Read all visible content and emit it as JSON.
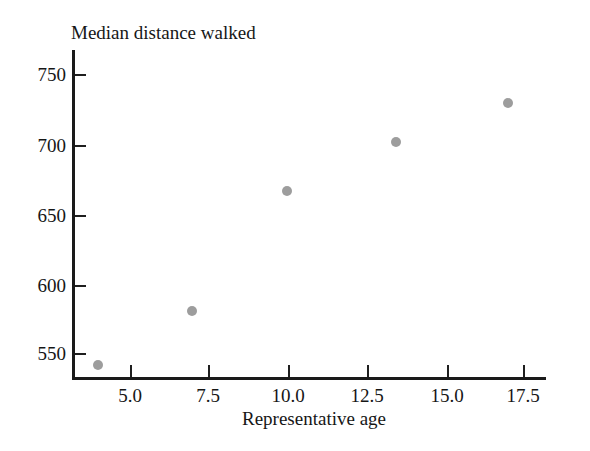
{
  "chart_data": {
    "type": "scatter",
    "title": "",
    "xlabel": "Representative age",
    "ylabel": "Median distance walked",
    "xlim": [
      3.0,
      18.5
    ],
    "ylim": [
      533,
      760
    ],
    "grid": false,
    "legend": "none",
    "marker_color": "#9d9d9d",
    "axis_color": "#1a1a1a",
    "xticks": [
      "5.0",
      "7.5",
      "10.0",
      "12.5",
      "15.0",
      "17.5"
    ],
    "xtick_values": [
      5.0,
      7.5,
      10.0,
      12.5,
      15.0,
      17.5
    ],
    "yticks": [
      "750",
      "700",
      "650",
      "600",
      "550"
    ],
    "ytick_values": [
      750,
      700,
      650,
      600,
      550
    ],
    "x": [
      4.0,
      7.0,
      10.0,
      13.5,
      17.0
    ],
    "y": [
      541,
      583,
      667,
      702,
      729
    ],
    "points": [
      {
        "x": 4.0,
        "y": 541,
        "px": 98,
        "py": 365
      },
      {
        "x": 7.0,
        "y": 583,
        "px": 192,
        "py": 311
      },
      {
        "x": 10.0,
        "y": 667,
        "px": 287,
        "py": 191
      },
      {
        "x": 13.5,
        "y": 702,
        "px": 396,
        "py": 142
      },
      {
        "x": 17.0,
        "y": 729,
        "px": 508,
        "py": 103
      }
    ]
  },
  "axes": {
    "y_caption": "Median distance walked",
    "x_caption": "Representative age",
    "ytick_px": [
      74,
      145,
      215,
      285,
      353
    ],
    "xtick_px": [
      130,
      208,
      288,
      367,
      447,
      523
    ]
  }
}
